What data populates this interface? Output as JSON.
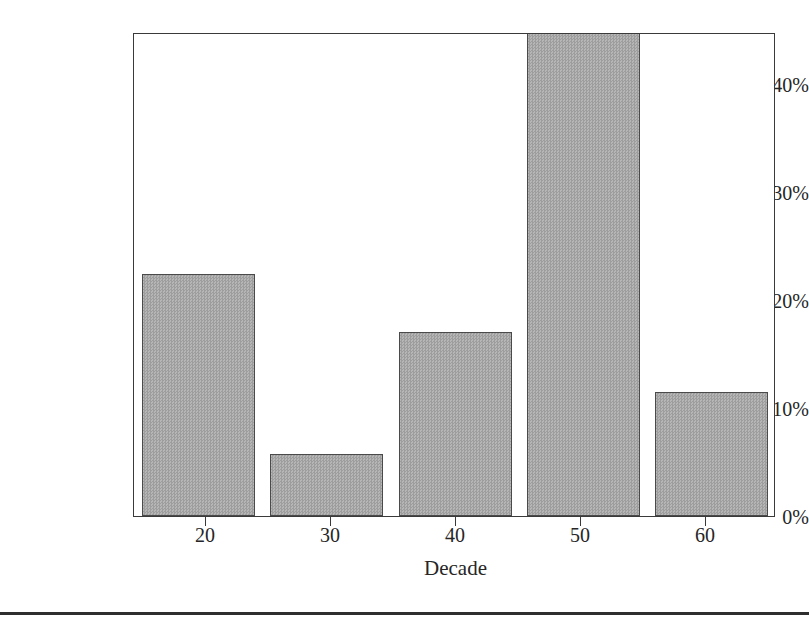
{
  "chart_data": {
    "type": "bar",
    "title": "",
    "xlabel": "Decade",
    "ylabel": "Percent of Frequency",
    "categories": [
      "20",
      "30",
      "40",
      "50",
      "60"
    ],
    "values": [
      22.4,
      5.7,
      17.0,
      44.8,
      11.5
    ],
    "value_labels_shown": false,
    "ylim": [
      0,
      44.8
    ],
    "xlim": [
      15,
      65
    ],
    "yticks": [
      0,
      10,
      20,
      30,
      40
    ],
    "ytick_labels": [
      "0%",
      "10%",
      "20%",
      "30%",
      "40%"
    ],
    "xticks": [
      20,
      30,
      40,
      50,
      60
    ],
    "xtick_labels": [
      "20",
      "30",
      "40",
      "50",
      "60"
    ],
    "grid": false,
    "legend": false,
    "legend_position": "none",
    "bar_fill_color": "#a9a9a9",
    "bar_edge_color": "#4a4a4a",
    "axis_color": "#3a3a3a",
    "background_color": "#ffffff",
    "text_color": "#262626"
  },
  "figure": {
    "bottom_rule_color": "#2e2e2e"
  }
}
